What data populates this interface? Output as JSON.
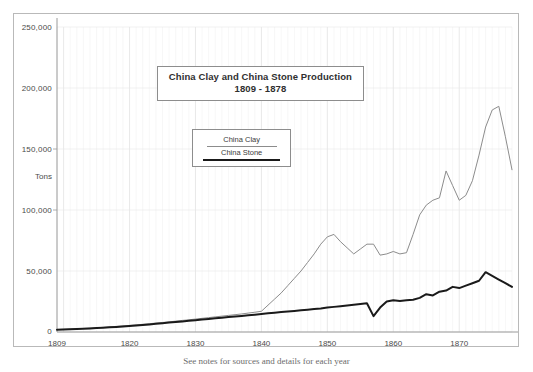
{
  "figure": {
    "title_line1": "China Clay and China Stone Production",
    "title_line2": "1809 - 1878",
    "caption": "See notes for sources and details for each year",
    "axis_label_y": "Tons",
    "legend": {
      "clay_label": "China Clay",
      "stone_label": "China Stone"
    },
    "colors": {
      "clay_line": "#8c8c8c",
      "stone_line": "#1a1a1a",
      "grid": "#e6e6e6",
      "axis": "#9a9a9a",
      "frame": "#b9b9b9",
      "text": "#3a3a3a"
    }
  },
  "chart_data": {
    "type": "line",
    "title": "China Clay and China Stone Production 1809 - 1878",
    "xlabel": "",
    "ylabel": "Tons",
    "xlim": [
      1809,
      1878
    ],
    "ylim": [
      0,
      250000
    ],
    "grid": true,
    "legend_position": "inside-upper-left",
    "ytick_labels": [
      "0",
      "50,000",
      "100,000",
      "150,000",
      "200,000",
      "250,000"
    ],
    "ytick_values": [
      0,
      50000,
      100000,
      150000,
      200000,
      250000
    ],
    "xtick_labels": [
      "1809",
      "1820",
      "1830",
      "1840",
      "1850",
      "1860",
      "1870"
    ],
    "xtick_values": [
      1809,
      1820,
      1830,
      1840,
      1850,
      1860,
      1870
    ],
    "x": [
      1809,
      1810,
      1811,
      1812,
      1813,
      1814,
      1815,
      1816,
      1817,
      1818,
      1819,
      1820,
      1821,
      1822,
      1823,
      1824,
      1825,
      1826,
      1827,
      1828,
      1829,
      1830,
      1831,
      1832,
      1833,
      1834,
      1835,
      1836,
      1837,
      1838,
      1839,
      1840,
      1841,
      1842,
      1843,
      1844,
      1845,
      1846,
      1847,
      1848,
      1849,
      1850,
      1851,
      1852,
      1853,
      1854,
      1855,
      1856,
      1857,
      1858,
      1859,
      1860,
      1861,
      1862,
      1863,
      1864,
      1865,
      1866,
      1867,
      1868,
      1869,
      1870,
      1871,
      1872,
      1873,
      1874,
      1875,
      1876,
      1877,
      1878
    ],
    "series": [
      {
        "name": "China Clay",
        "color": "#8c8c8c",
        "linewidth": 1,
        "values": [
          2000,
          2200,
          2400,
          2600,
          2900,
          3200,
          3500,
          3800,
          4200,
          4600,
          5000,
          5400,
          5800,
          6300,
          6800,
          7300,
          7800,
          8300,
          8900,
          9500,
          10000,
          10600,
          11200,
          11800,
          12400,
          13000,
          13600,
          14200,
          14800,
          15500,
          16200,
          17000,
          22000,
          27000,
          32000,
          38000,
          44000,
          50000,
          57000,
          64000,
          72000,
          78000,
          80000,
          74000,
          69000,
          64000,
          68000,
          72000,
          72000,
          63000,
          64000,
          66000,
          64000,
          65000,
          80000,
          96000,
          104000,
          108000,
          110000,
          132000,
          120000,
          108000,
          112000,
          124000,
          145000,
          168000,
          182000,
          185000,
          160000,
          133000
        ]
      },
      {
        "name": "China Stone",
        "color": "#1a1a1a",
        "linewidth": 2,
        "values": [
          1800,
          2000,
          2200,
          2400,
          2600,
          2900,
          3200,
          3500,
          3800,
          4200,
          4600,
          5000,
          5400,
          5800,
          6200,
          6700,
          7200,
          7700,
          8200,
          8700,
          9200,
          9700,
          10200,
          10700,
          11200,
          11700,
          12200,
          12700,
          13200,
          13700,
          14200,
          14800,
          15300,
          15800,
          16300,
          16800,
          17300,
          17800,
          18300,
          18800,
          19300,
          20000,
          20600,
          21200,
          21800,
          22400,
          23000,
          23500,
          13000,
          20000,
          25000,
          26000,
          25500,
          26000,
          26500,
          28000,
          31000,
          30000,
          33000,
          34000,
          37000,
          36000,
          38000,
          40000,
          42000,
          49000,
          46000,
          43000,
          40000,
          37000
        ]
      }
    ]
  }
}
